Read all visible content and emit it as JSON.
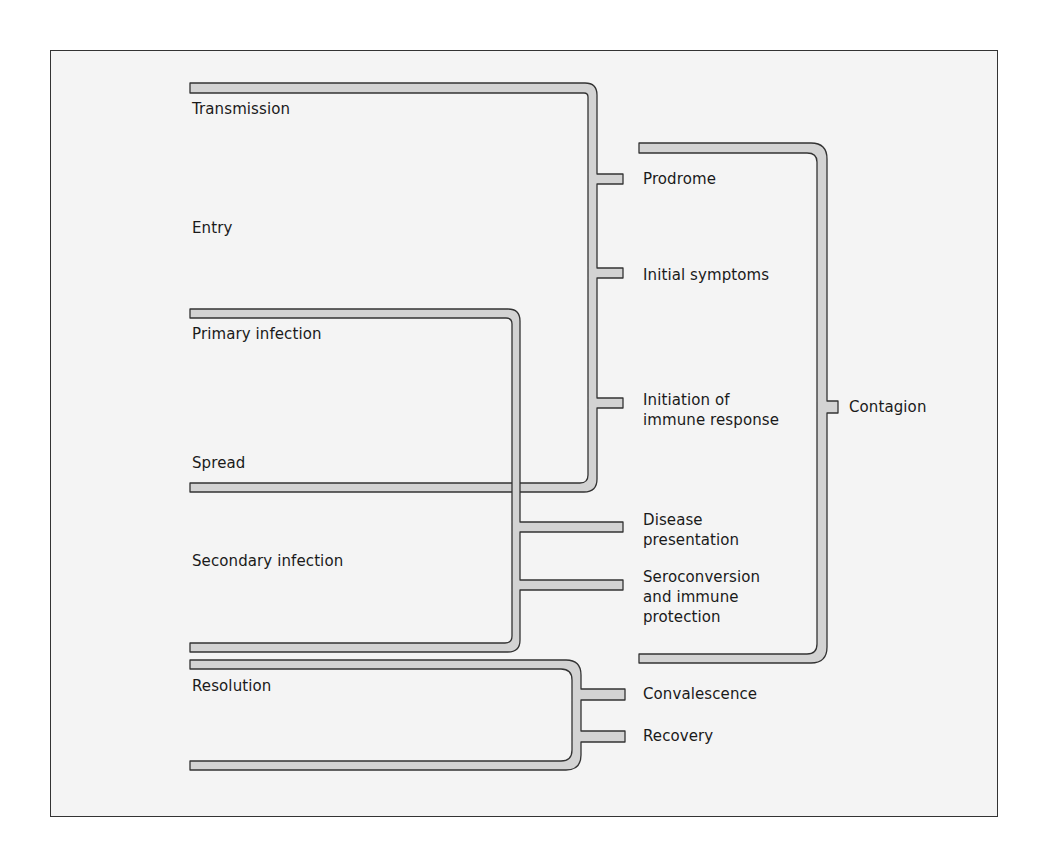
{
  "diagram": {
    "colors": {
      "background": "#f4f4f4",
      "bar_fill": "#d3d3d3",
      "bar_stroke": "#333333",
      "frame": "#333333",
      "text": "#1a1a1a"
    },
    "left_stages": [
      {
        "id": "transmission",
        "label": "Transmission"
      },
      {
        "id": "entry",
        "label": "Entry"
      },
      {
        "id": "primary-infection",
        "label": "Primary infection"
      },
      {
        "id": "spread",
        "label": "Spread"
      },
      {
        "id": "secondary-infection",
        "label": "Secondary infection"
      },
      {
        "id": "resolution",
        "label": "Resolution"
      }
    ],
    "middle_outcomes": [
      {
        "id": "prodrome",
        "label": "Prodrome"
      },
      {
        "id": "initial-symptoms",
        "label": "Initial symptoms"
      },
      {
        "id": "initiation-immune-response",
        "label": "Initiation of\nimmune response"
      },
      {
        "id": "disease-presentation",
        "label": "Disease\npresentation"
      },
      {
        "id": "seroconversion",
        "label": "Seroconversion\nand immune\nprotection"
      },
      {
        "id": "convalescence",
        "label": "Convalescence"
      },
      {
        "id": "recovery",
        "label": "Recovery"
      }
    ],
    "right_outcome": {
      "id": "contagion",
      "label": "Contagion"
    },
    "connections": [
      {
        "from": [
          "Transmission",
          "Entry"
        ],
        "to": [
          "Prodrome",
          "Initial symptoms",
          "Initiation of immune response"
        ]
      },
      {
        "from": [
          "Primary infection",
          "Spread",
          "Secondary infection"
        ],
        "to": [
          "Disease presentation",
          "Seroconversion and immune protection"
        ]
      },
      {
        "from": [
          "Resolution"
        ],
        "to": [
          "Convalescence",
          "Recovery"
        ]
      },
      {
        "from": [
          "Prodrome",
          "Initial symptoms",
          "Initiation of immune response",
          "Disease presentation",
          "Seroconversion and immune protection"
        ],
        "to": [
          "Contagion"
        ]
      }
    ]
  }
}
